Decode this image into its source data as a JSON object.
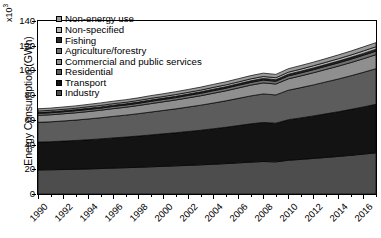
{
  "chart_data": {
    "type": "area",
    "title": "",
    "xlabel": "",
    "ylabel": "Energy Consumption (GWh)",
    "multiplier": "x10",
    "multiplier_exp": "3",
    "ylim": [
      0,
      140
    ],
    "yticks": [
      0,
      20,
      40,
      60,
      80,
      100,
      120,
      140
    ],
    "xlim": [
      1990,
      2017
    ],
    "xticks": [
      1990,
      1992,
      1994,
      1996,
      1998,
      2000,
      2002,
      2004,
      2006,
      2008,
      2010,
      2012,
      2014,
      2016
    ],
    "x": [
      1990,
      1991,
      1992,
      1993,
      1994,
      1995,
      1996,
      1997,
      1998,
      1999,
      2000,
      2001,
      2002,
      2003,
      2004,
      2005,
      2006,
      2007,
      2008,
      2009,
      2010,
      2011,
      2012,
      2013,
      2014,
      2015,
      2016,
      2017
    ],
    "grid": false,
    "legend_position": "upper-left",
    "stack_order_bottom_to_top": [
      "Industry",
      "Transport",
      "Residential",
      "Commercial and public services",
      "Agriculture/forestry",
      "Fishing",
      "Non-specified",
      "Non-energy use"
    ],
    "series": [
      {
        "name": "Industry",
        "color": "#4d4d4d",
        "values": [
          19.5,
          19.6,
          19.8,
          20.0,
          20.3,
          20.6,
          21.0,
          21.3,
          21.6,
          22.0,
          22.4,
          22.8,
          23.2,
          23.6,
          24.1,
          24.6,
          25.2,
          25.8,
          26.3,
          26.0,
          27.3,
          28.0,
          28.8,
          29.6,
          30.4,
          31.3,
          32.3,
          33.3
        ]
      },
      {
        "name": "Transport",
        "color": "#131313",
        "values": [
          22.5,
          22.7,
          23.0,
          23.3,
          23.6,
          24.0,
          24.4,
          24.8,
          25.3,
          25.8,
          26.3,
          26.8,
          27.4,
          28.0,
          28.7,
          29.4,
          30.2,
          31.0,
          31.6,
          31.3,
          32.8,
          33.6,
          34.4,
          35.3,
          36.2,
          37.2,
          38.2,
          39.3
        ]
      },
      {
        "name": "Residential",
        "color": "#5c5c5c",
        "values": [
          16.0,
          16.1,
          16.3,
          16.5,
          16.8,
          17.1,
          17.4,
          17.7,
          18.1,
          18.5,
          18.9,
          19.3,
          19.8,
          20.3,
          20.8,
          21.4,
          22.0,
          22.6,
          23.1,
          22.9,
          23.9,
          24.5,
          25.1,
          25.8,
          26.5,
          27.2,
          28.0,
          28.8
        ]
      },
      {
        "name": "Commercial and public services",
        "color": "#8f8f8f",
        "values": [
          5.6,
          5.7,
          5.8,
          5.9,
          6.0,
          6.1,
          6.3,
          6.4,
          6.6,
          6.8,
          7.0,
          7.2,
          7.4,
          7.6,
          7.9,
          8.1,
          8.4,
          8.7,
          8.9,
          8.8,
          9.2,
          9.5,
          9.8,
          10.1,
          10.4,
          10.7,
          11.0,
          11.4
        ]
      },
      {
        "name": "Agriculture/forestry",
        "color": "#707070",
        "values": [
          1.6,
          1.6,
          1.6,
          1.7,
          1.7,
          1.7,
          1.8,
          1.8,
          1.8,
          1.9,
          1.9,
          1.9,
          2.0,
          2.0,
          2.1,
          2.1,
          2.2,
          2.2,
          2.3,
          2.2,
          2.4,
          2.4,
          2.5,
          2.6,
          2.6,
          2.7,
          2.8,
          2.8
        ]
      },
      {
        "name": "Fishing",
        "color": "#2b2b2b",
        "values": [
          0.9,
          0.9,
          0.9,
          0.9,
          1.0,
          1.0,
          1.0,
          1.0,
          1.0,
          1.1,
          1.1,
          1.1,
          1.1,
          1.2,
          1.2,
          1.2,
          1.2,
          1.3,
          1.3,
          1.3,
          1.3,
          1.4,
          1.4,
          1.4,
          1.5,
          1.5,
          1.5,
          1.6
        ]
      },
      {
        "name": "Non-specified",
        "color": "#b5b5b5",
        "values": [
          1.1,
          1.1,
          1.1,
          1.1,
          1.2,
          1.2,
          1.2,
          1.2,
          1.3,
          1.3,
          1.3,
          1.4,
          1.4,
          1.4,
          1.5,
          1.5,
          1.5,
          1.6,
          1.6,
          1.6,
          1.7,
          1.7,
          1.8,
          1.8,
          1.9,
          1.9,
          2.0,
          2.0
        ]
      },
      {
        "name": "Non-energy use",
        "color": "#9a9a9a",
        "values": [
          1.8,
          1.8,
          1.9,
          1.9,
          1.9,
          2.0,
          2.0,
          2.1,
          2.1,
          2.2,
          2.2,
          2.3,
          2.3,
          2.4,
          2.4,
          2.5,
          2.6,
          2.6,
          2.7,
          2.7,
          2.8,
          2.9,
          2.9,
          3.0,
          3.1,
          3.2,
          3.3,
          3.3
        ]
      }
    ]
  },
  "legend": {
    "items": [
      {
        "label": "Non-energy use",
        "color": "#9a9a9a"
      },
      {
        "label": "Non-specified",
        "color": "#b5b5b5"
      },
      {
        "label": "Fishing",
        "color": "#2b2b2b"
      },
      {
        "label": "Agriculture/forestry",
        "color": "#707070"
      },
      {
        "label": "Commercial and public services",
        "color": "#8f8f8f"
      },
      {
        "label": "Residential",
        "color": "#5c5c5c"
      },
      {
        "label": "Transport",
        "color": "#131313"
      },
      {
        "label": "Industry",
        "color": "#4d4d4d"
      }
    ]
  }
}
